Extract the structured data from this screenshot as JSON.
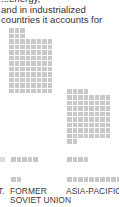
{
  "intro_text": {
    "lines": [
      "...energy,",
      "and in industrialized",
      "countries it accounts for"
    ]
  },
  "chart_data": {
    "type": "waffle",
    "title": "",
    "unit_description": "each square represents one unit of energy use",
    "categories": [
      "FORMER SOVIET UNION",
      "ASIA-PACIFIC"
    ],
    "series": [
      {
        "name": "Row group 1 (main block)",
        "values": [
          86,
          70
        ]
      },
      {
        "name": "Row group 2",
        "values": [
          5,
          4
        ]
      },
      {
        "name": "Row group 3",
        "values": [
          2,
          10
        ]
      }
    ],
    "cut_off_label_left": "T.",
    "legend": null,
    "grid": false
  },
  "labels": {
    "left_partial": "T.",
    "col1_line1": "FORMER",
    "col1_line2": "SOVIET UNION",
    "col2_line1": "ASIA-PACIFIC"
  },
  "colors": {
    "square": "#c9c9c9",
    "text": "#3a3a3a",
    "background": "#ffffff"
  }
}
